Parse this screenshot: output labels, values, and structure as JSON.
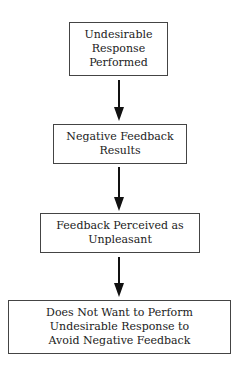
{
  "diagram": {
    "type": "flowchart",
    "direction": "top-to-bottom",
    "nodes": [
      {
        "id": "n1",
        "lines": [
          "Undesirable",
          "Response",
          "Performed"
        ]
      },
      {
        "id": "n2",
        "lines": [
          "Negative Feedback",
          "Results"
        ]
      },
      {
        "id": "n3",
        "lines": [
          "Feedback Perceived as",
          "Unpleasant"
        ]
      },
      {
        "id": "n4",
        "lines": [
          "Does Not Want to Perform",
          "Undesirable Response to",
          "Avoid Negative Feedback"
        ]
      }
    ],
    "edges": [
      {
        "from": "n1",
        "to": "n2"
      },
      {
        "from": "n2",
        "to": "n3"
      },
      {
        "from": "n3",
        "to": "n4"
      }
    ]
  }
}
